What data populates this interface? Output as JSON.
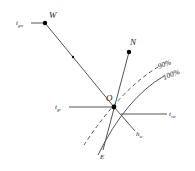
{
  "diagram": {
    "points": {
      "W": {
        "label": "W"
      },
      "N": {
        "label": "N"
      },
      "O": {
        "label": "O"
      },
      "E": {
        "label": "E"
      }
    },
    "labels": {
      "t_gw": {
        "main": "t",
        "sub": "gw"
      },
      "t_gr": {
        "main": "t",
        "sub": "gr"
      },
      "t_sw": {
        "main": "t",
        "sub": "sw"
      },
      "h_w": {
        "main": "h",
        "sub": "w"
      }
    },
    "curves": {
      "rh90": {
        "label": "90%",
        "style": "dashed"
      },
      "rh100": {
        "label": "100%",
        "style": "solid"
      }
    },
    "colors": {
      "line": "#555555",
      "dot": "#000000",
      "text": "#222222"
    }
  }
}
